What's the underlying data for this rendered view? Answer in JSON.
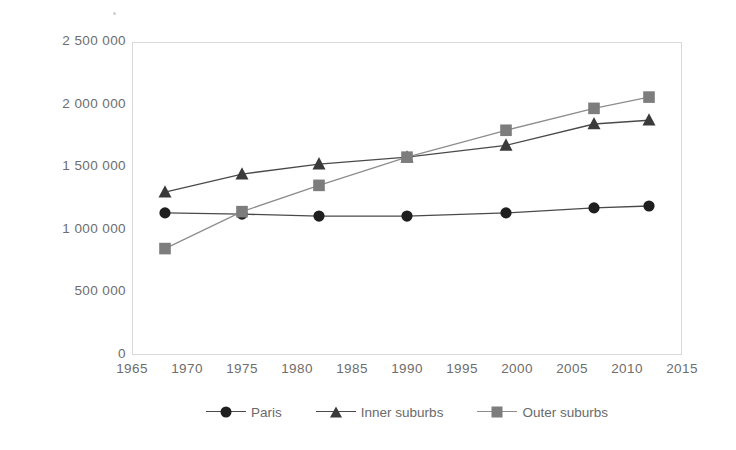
{
  "chart_data": {
    "type": "line",
    "title": "",
    "subtitle": "",
    "xlabel": "",
    "ylabel": "",
    "xlim": [
      1965,
      2015
    ],
    "ylim": [
      0,
      2500000
    ],
    "grid": false,
    "legend_position": "bottom",
    "x_tick_labels": [
      "1965",
      "1970",
      "1975",
      "1980",
      "1985",
      "1990",
      "1995",
      "2000",
      "2005",
      "2010",
      "2015"
    ],
    "x_ticks": [
      1965,
      1970,
      1975,
      1980,
      1985,
      1990,
      1995,
      2000,
      2005,
      2010,
      2015
    ],
    "y_tick_labels": [
      "2 500 000",
      "2 000 000",
      "1 500 000",
      "1 000 000",
      "500 000",
      "0"
    ],
    "y_ticks": [
      2500000,
      2000000,
      1500000,
      1000000,
      500000,
      0
    ],
    "x": [
      1968,
      1975,
      1982,
      1990,
      1999,
      2007,
      2012
    ],
    "series": [
      {
        "name": "Paris",
        "marker": "circle",
        "color": "#1f1f1f",
        "line_color": "#4a4a4a",
        "values": [
          1135000,
          1125000,
          1110000,
          1110000,
          1135000,
          1175000,
          1190000
        ]
      },
      {
        "name": "Inner suburbs",
        "marker": "triangle",
        "color": "#3a3a3a",
        "line_color": "#4a4a4a",
        "values": [
          1300000,
          1445000,
          1525000,
          1580000,
          1675000,
          1845000,
          1875000
        ]
      },
      {
        "name": "Outer suburbs",
        "marker": "square",
        "color": "#7d7d7d",
        "line_color": "#8d8d8d",
        "values": [
          850000,
          1145000,
          1355000,
          1580000,
          1795000,
          1970000,
          2060000
        ]
      }
    ]
  },
  "legend": {
    "entries": [
      {
        "label": "Paris"
      },
      {
        "label": "Inner suburbs"
      },
      {
        "label": "Outer suburbs"
      }
    ]
  },
  "colors": {
    "frame": "#d9d9d9",
    "tick_text": "#6d6d6d",
    "legend_text": "#6a6a6a",
    "background": "#ffffff"
  }
}
